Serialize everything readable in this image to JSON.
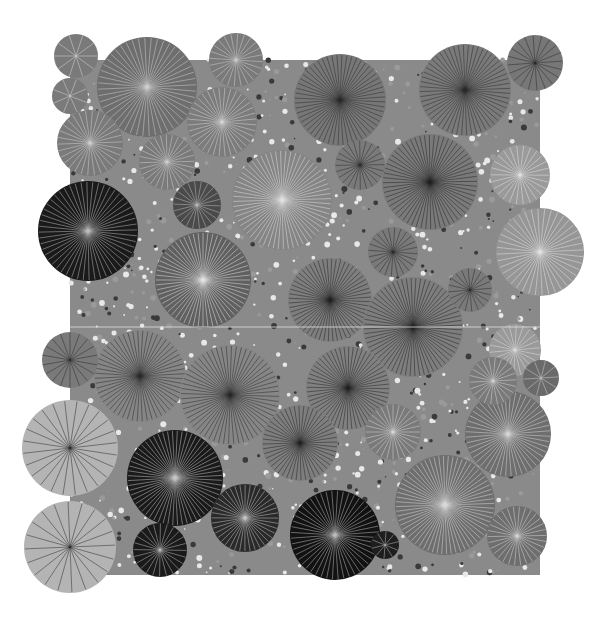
{
  "artwork": {
    "title": "",
    "width": 615,
    "height": 634,
    "background": "#ffffff",
    "frame": {
      "x": 70,
      "y": 60,
      "w": 470,
      "h": 515,
      "fill": "#8a8a8a"
    },
    "seam_y": 327,
    "circles": [
      {
        "cx": 76,
        "cy": 56,
        "r": 22,
        "fill": "#7a7a7a",
        "line": "#d8d8d8",
        "n": 10
      },
      {
        "cx": 70,
        "cy": 96,
        "r": 18,
        "fill": "#7a7a7a",
        "line": "#d8d8d8",
        "n": 8
      },
      {
        "cx": 147,
        "cy": 87,
        "r": 50,
        "fill": "#6e6e6e",
        "line": "#d0d0d0",
        "n": 48
      },
      {
        "cx": 236,
        "cy": 60,
        "r": 27,
        "fill": "#7a7a7a",
        "line": "#cfcfcf",
        "n": 24
      },
      {
        "cx": 222,
        "cy": 122,
        "r": 35,
        "fill": "#7c7c7c",
        "line": "#d5d5d5",
        "n": 36
      },
      {
        "cx": 90,
        "cy": 143,
        "r": 33,
        "fill": "#7a7a7a",
        "line": "#d2d2d2",
        "n": 30
      },
      {
        "cx": 167,
        "cy": 162,
        "r": 28,
        "fill": "#7a7a7a",
        "line": "#d2d2d2",
        "n": 28
      },
      {
        "cx": 282,
        "cy": 200,
        "r": 50,
        "fill": "#858585",
        "line": "#e2e2e2",
        "n": 60
      },
      {
        "cx": 340,
        "cy": 100,
        "r": 46,
        "fill": "#777777",
        "line": "#2a2a2a",
        "n": 56
      },
      {
        "cx": 465,
        "cy": 90,
        "r": 46,
        "fill": "#7a7a7a",
        "line": "#2a2a2a",
        "n": 56
      },
      {
        "cx": 535,
        "cy": 63,
        "r": 28,
        "fill": "#777777",
        "line": "#2a2a2a",
        "n": 20
      },
      {
        "cx": 430,
        "cy": 182,
        "r": 48,
        "fill": "#7a7a7a",
        "line": "#222222",
        "n": 60
      },
      {
        "cx": 360,
        "cy": 165,
        "r": 25,
        "fill": "#7a7a7a",
        "line": "#2a2a2a",
        "n": 24
      },
      {
        "cx": 88,
        "cy": 231,
        "r": 50,
        "fill": "#1a1a1a",
        "line": "#bdbdbd",
        "n": 52
      },
      {
        "cx": 197,
        "cy": 205,
        "r": 24,
        "fill": "#4a4a4a",
        "line": "#bdbdbd",
        "n": 22
      },
      {
        "cx": 203,
        "cy": 280,
        "r": 48,
        "fill": "#606060",
        "line": "#e4e4e4",
        "n": 60
      },
      {
        "cx": 540,
        "cy": 252,
        "r": 44,
        "fill": "#969696",
        "line": "#e6e6e6",
        "n": 40
      },
      {
        "cx": 520,
        "cy": 175,
        "r": 30,
        "fill": "#9a9a9a",
        "line": "#e6e6e6",
        "n": 26
      },
      {
        "cx": 330,
        "cy": 300,
        "r": 42,
        "fill": "#7e7e7e",
        "line": "#222222",
        "n": 56
      },
      {
        "cx": 413,
        "cy": 327,
        "r": 50,
        "fill": "#7e7e7e",
        "line": "#222222",
        "n": 64
      },
      {
        "cx": 393,
        "cy": 252,
        "r": 25,
        "fill": "#7a7a7a",
        "line": "#2a2a2a",
        "n": 24
      },
      {
        "cx": 470,
        "cy": 290,
        "r": 22,
        "fill": "#7a7a7a",
        "line": "#2a2a2a",
        "n": 20
      },
      {
        "cx": 140,
        "cy": 376,
        "r": 46,
        "fill": "#868686",
        "line": "#2a2a2a",
        "n": 56
      },
      {
        "cx": 230,
        "cy": 395,
        "r": 50,
        "fill": "#868686",
        "line": "#2a2a2a",
        "n": 60
      },
      {
        "cx": 348,
        "cy": 388,
        "r": 42,
        "fill": "#808080",
        "line": "#222222",
        "n": 56
      },
      {
        "cx": 70,
        "cy": 360,
        "r": 28,
        "fill": "#7a7a7a",
        "line": "#2a2a2a",
        "n": 18
      },
      {
        "cx": 515,
        "cy": 350,
        "r": 26,
        "fill": "#9a9a9a",
        "line": "#e0e0e0",
        "n": 22
      },
      {
        "cx": 541,
        "cy": 378,
        "r": 18,
        "fill": "#6a6a6a",
        "line": "#d0d0d0",
        "n": 10
      },
      {
        "cx": 70,
        "cy": 448,
        "r": 48,
        "fill": "#b4b4b4",
        "line": "#2a2a2a",
        "n": 24
      },
      {
        "cx": 175,
        "cy": 478,
        "r": 48,
        "fill": "#1a1a1a",
        "line": "#c8c8c8",
        "n": 60
      },
      {
        "cx": 300,
        "cy": 443,
        "r": 38,
        "fill": "#7e7e7e",
        "line": "#222222",
        "n": 48
      },
      {
        "cx": 245,
        "cy": 518,
        "r": 34,
        "fill": "#2a2a2a",
        "line": "#c8c8c8",
        "n": 40
      },
      {
        "cx": 335,
        "cy": 535,
        "r": 45,
        "fill": "#121212",
        "line": "#bdbdbd",
        "n": 48
      },
      {
        "cx": 70,
        "cy": 547,
        "r": 46,
        "fill": "#b4b4b4",
        "line": "#2a2a2a",
        "n": 20
      },
      {
        "cx": 160,
        "cy": 550,
        "r": 27,
        "fill": "#1a1a1a",
        "line": "#c0c0c0",
        "n": 24
      },
      {
        "cx": 385,
        "cy": 545,
        "r": 14,
        "fill": "#1e1e1e",
        "line": "#bdbdbd",
        "n": 10
      },
      {
        "cx": 445,
        "cy": 505,
        "r": 50,
        "fill": "#6e6e6e",
        "line": "#dcdcdc",
        "n": 64
      },
      {
        "cx": 393,
        "cy": 432,
        "r": 28,
        "fill": "#7a7a7a",
        "line": "#d8d8d8",
        "n": 28
      },
      {
        "cx": 508,
        "cy": 434,
        "r": 43,
        "fill": "#6e6e6e",
        "line": "#d8d8d8",
        "n": 48
      },
      {
        "cx": 517,
        "cy": 536,
        "r": 30,
        "fill": "#6e6e6e",
        "line": "#d8d8d8",
        "n": 30
      },
      {
        "cx": 493,
        "cy": 381,
        "r": 24,
        "fill": "#7a7a7a",
        "line": "#d8d8d8",
        "n": 22
      }
    ]
  }
}
